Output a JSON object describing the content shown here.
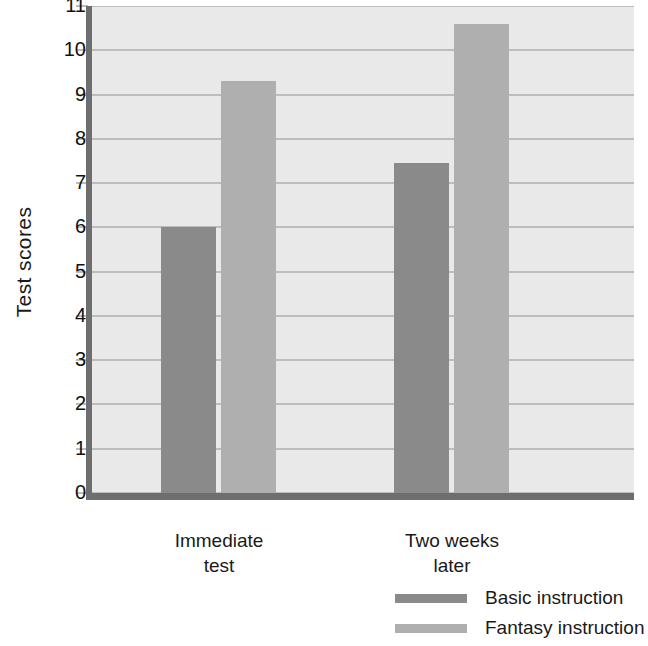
{
  "chart_data": {
    "type": "bar",
    "title": "",
    "xlabel": "",
    "ylabel": "Test scores",
    "categories": [
      "Immediate\ntest",
      "Two weeks\nlater"
    ],
    "series": [
      {
        "name": "Basic instruction",
        "color": "#8a8a8a",
        "values": [
          6.0,
          7.45
        ]
      },
      {
        "name": "Fantasy instruction",
        "color": "#afafaf",
        "values": [
          9.3,
          10.6
        ]
      }
    ],
    "ylim": [
      0,
      11
    ],
    "yticks": [
      "0",
      "1",
      "2",
      "3",
      "4",
      "5",
      "6",
      "7",
      "8",
      "9",
      "10",
      "11"
    ],
    "grid": true,
    "legend_position": "bottom-right",
    "plot_background": "#e9e9e9",
    "gridline_color": "#bdbdbd",
    "axis_color": "#6e6e6e"
  }
}
